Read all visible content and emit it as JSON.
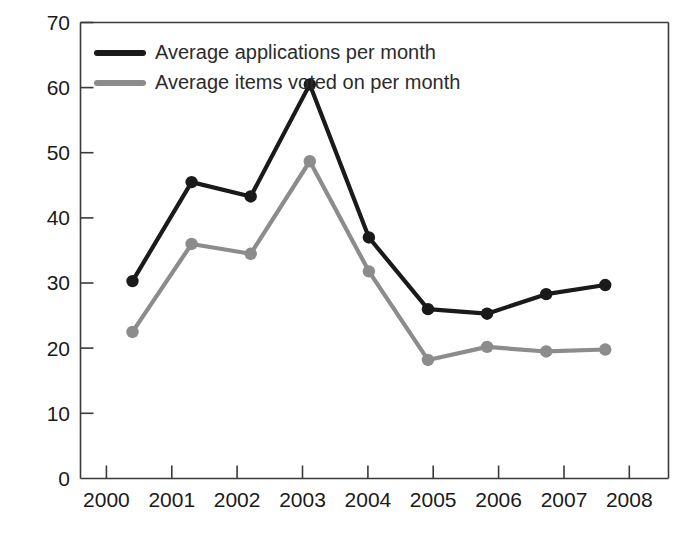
{
  "chart_data": {
    "type": "line",
    "title": "",
    "xlabel": "",
    "ylabel": "",
    "categories": [
      "2000",
      "2001",
      "2002",
      "2003",
      "2004",
      "2005",
      "2006",
      "2007",
      "2008"
    ],
    "x": [
      2000,
      2001,
      2002,
      2003,
      2004,
      2005,
      2006,
      2007,
      2008
    ],
    "ylim": [
      0,
      70
    ],
    "yticks": [
      0,
      10,
      20,
      30,
      40,
      50,
      60,
      70
    ],
    "ytick_labels": [
      "0",
      "10",
      "20",
      "30",
      "40",
      "50",
      "60",
      "70"
    ],
    "grid": false,
    "legend_position": "top-left",
    "markers": "circle",
    "series": [
      {
        "name": "Average applications per month",
        "color": "#1a1a1a",
        "values": [
          30.3,
          45.5,
          43.3,
          60.5,
          37.0,
          26.0,
          25.3,
          28.3,
          29.7
        ]
      },
      {
        "name": "Average items voted on per month",
        "color": "#8c8c8c",
        "values": [
          22.5,
          36.0,
          34.5,
          48.7,
          31.8,
          18.2,
          20.2,
          19.5,
          19.8
        ]
      }
    ]
  },
  "legend": {
    "entries": [
      {
        "label": "Average applications per month",
        "color": "#1a1a1a"
      },
      {
        "label": "Average items voted on per month",
        "color": "#8c8c8c"
      }
    ]
  },
  "axes": {
    "y_tick_labels": [
      "70",
      "60",
      "50",
      "40",
      "30",
      "20",
      "10",
      "0"
    ],
    "x_tick_labels": [
      "2000",
      "2001",
      "2002",
      "2003",
      "2004",
      "2005",
      "2006",
      "2007",
      "2008"
    ]
  },
  "colors": {
    "series_primary": "#1a1a1a",
    "series_secondary": "#8c8c8c",
    "axis": "#3a3a3a",
    "background": "#ffffff",
    "text": "#1a1a1a"
  }
}
